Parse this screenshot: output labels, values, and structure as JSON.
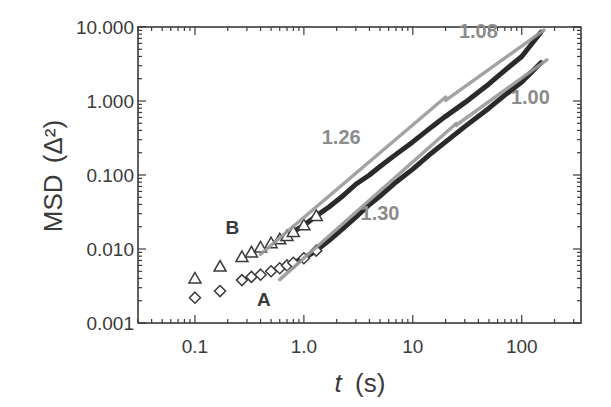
{
  "chart_data": {
    "type": "scatter",
    "title": "",
    "xlabel": "t (s)",
    "xlabel_italic_part": "t",
    "xlabel_unit": "(s)",
    "ylabel": "MSD (Δ²)",
    "ylabel_main": "MSD",
    "ylabel_unit": "(Δ²)",
    "xscale": "log",
    "yscale": "log",
    "xlim": [
      0.03,
      350
    ],
    "ylim": [
      0.001,
      10
    ],
    "x_ticks": [
      0.1,
      1,
      10,
      100
    ],
    "x_tick_labels": [
      "0.1",
      "1.0",
      "10",
      "100"
    ],
    "y_ticks": [
      0.001,
      0.01,
      0.1,
      1,
      10
    ],
    "y_tick_labels": [
      "0.001",
      "0.010",
      "0.100",
      "1.000",
      "10.000"
    ],
    "grid": false,
    "legend": "none (inline labels A and B)",
    "series": [
      {
        "name": "B",
        "marker": "triangle",
        "x": [
          0.1,
          0.17,
          0.27,
          0.33,
          0.4,
          0.5,
          0.6,
          0.7,
          0.8,
          1.0,
          1.3,
          1.7,
          2.2,
          3,
          4,
          5,
          7,
          10,
          15,
          20,
          30,
          50,
          70,
          100,
          150
        ],
        "values": [
          0.004,
          0.0058,
          0.0078,
          0.009,
          0.0105,
          0.012,
          0.0135,
          0.015,
          0.017,
          0.021,
          0.028,
          0.037,
          0.05,
          0.075,
          0.1,
          0.13,
          0.19,
          0.28,
          0.45,
          0.62,
          0.95,
          1.7,
          2.6,
          4.0,
          8.5
        ]
      },
      {
        "name": "A",
        "marker": "diamond",
        "x": [
          0.1,
          0.17,
          0.27,
          0.33,
          0.4,
          0.5,
          0.6,
          0.7,
          0.8,
          1.0,
          1.3,
          1.7,
          2.2,
          3,
          4,
          5,
          7,
          10,
          15,
          20,
          30,
          50,
          70,
          100,
          150
        ],
        "values": [
          0.0022,
          0.0027,
          0.0038,
          0.0042,
          0.0045,
          0.005,
          0.0055,
          0.006,
          0.0065,
          0.0075,
          0.0095,
          0.013,
          0.018,
          0.027,
          0.04,
          0.052,
          0.08,
          0.12,
          0.2,
          0.28,
          0.45,
          0.8,
          1.2,
          1.8,
          3.3
        ]
      }
    ],
    "fit_lines": [
      {
        "label": "1.26",
        "series": "B",
        "x": [
          0.4,
          20
        ],
        "y": [
          0.0075,
          1.0
        ]
      },
      {
        "label": "1.08",
        "series": "B",
        "x": [
          20,
          160
        ],
        "y": [
          0.9,
          8.0
        ]
      },
      {
        "label": "1.30",
        "series": "A",
        "x": [
          0.6,
          25
        ],
        "y": [
          0.0045,
          0.58
        ]
      },
      {
        "label": "1.00",
        "series": "A",
        "x": [
          25,
          170
        ],
        "y": [
          0.55,
          4.2
        ]
      }
    ],
    "annotations": [
      {
        "text": "1.26",
        "x": 2.2,
        "y": 0.26
      },
      {
        "text": "1.08",
        "x": 40,
        "y": 7.0
      },
      {
        "text": "1.30",
        "x": 5,
        "y": 0.025
      },
      {
        "text": "1.00",
        "x": 120,
        "y": 0.9
      },
      {
        "text": "A",
        "x": 0.43,
        "y": 0.0017
      },
      {
        "text": "B",
        "x": 0.22,
        "y": 0.016
      }
    ]
  },
  "colors": {
    "axis": "#3a3a3a",
    "markers": "#3a3a3a",
    "data_line": "#2a2a2a",
    "fit_line": "#9a9a9a",
    "slope_label": "#8c8c8c"
  }
}
